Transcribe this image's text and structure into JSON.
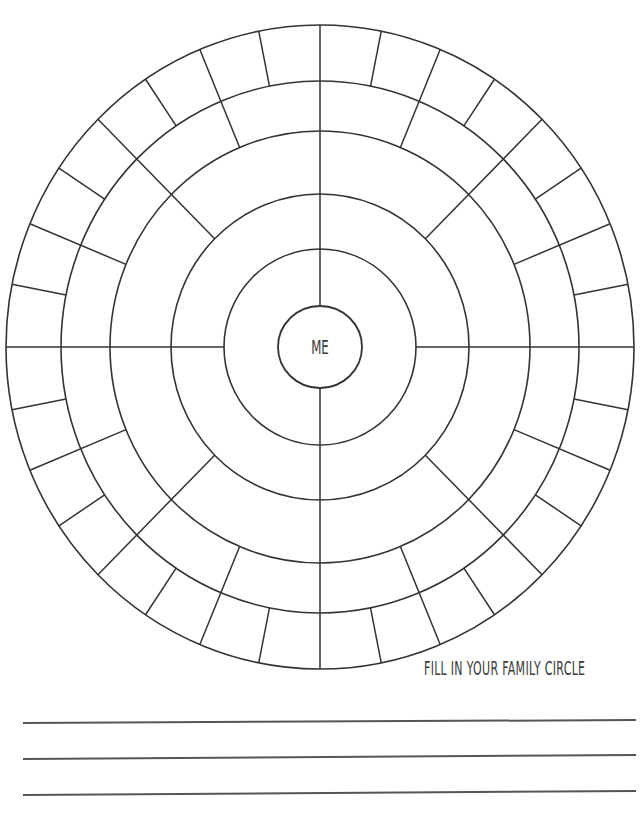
{
  "worksheet": {
    "center_label": "ME",
    "caption": "FILL IN YOUR FAMILY CIRCLE",
    "stroke_color": "#333333",
    "line_color": "#555555"
  },
  "family_circle": {
    "center": [
      320,
      347
    ],
    "rings_rx": [
      42,
      96,
      149,
      210,
      259,
      314
    ],
    "rings_ry": [
      41,
      98,
      153,
      216,
      266,
      322
    ],
    "generations": [
      {
        "name": "me",
        "inner": 0,
        "outer": 0,
        "segments": 1
      },
      {
        "name": "parents",
        "inner": 0,
        "outer": 1,
        "segments": 2,
        "start_deg": 90
      },
      {
        "name": "grandparents",
        "inner": 1,
        "outer": 2,
        "segments": 4,
        "start_deg": 0
      },
      {
        "name": "great-grandparents",
        "inner": 2,
        "outer": 3,
        "segments": 8,
        "start_deg": 0
      },
      {
        "name": "2x-great-grandparents",
        "inner": 3,
        "outer": 4,
        "segments": 16,
        "start_deg": 0
      },
      {
        "name": "3x-great-grandparents",
        "inner": 4,
        "outer": 5,
        "segments": 32,
        "start_deg": 0
      }
    ]
  },
  "writing_lines": [
    {
      "x1": 23,
      "y1": 723,
      "x2": 636,
      "y2": 720
    },
    {
      "x1": 23,
      "y1": 759,
      "x2": 636,
      "y2": 755
    },
    {
      "x1": 23,
      "y1": 795,
      "x2": 636,
      "y2": 791
    }
  ]
}
